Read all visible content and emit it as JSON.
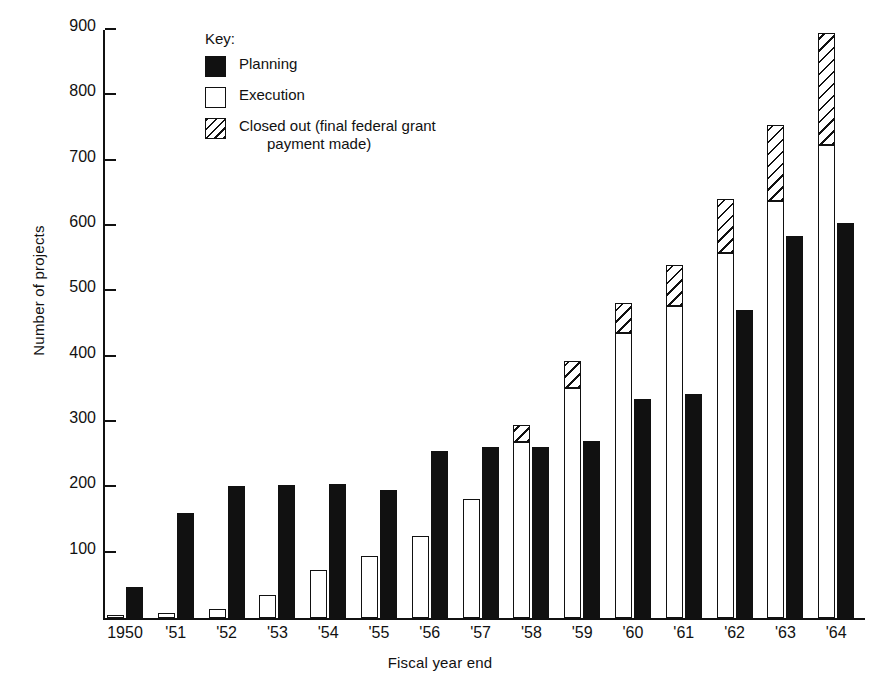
{
  "chart_data": {
    "type": "bar",
    "title": "",
    "xlabel": "Fiscal year end",
    "ylabel": "Number of projects",
    "ylim": [
      0,
      900
    ],
    "yticks": [
      100,
      200,
      300,
      400,
      500,
      600,
      700,
      800,
      900
    ],
    "grid": false,
    "legend_position": "upper-left-inside",
    "legend_title": "Key:",
    "bar_mode": "grouped-with-stacked-execution",
    "categories": [
      "1950",
      "'51",
      "'52",
      "'53",
      "'54",
      "'55",
      "'56",
      "'57",
      "'58",
      "'59",
      "'60",
      "'61",
      "'62",
      "'63",
      "'64"
    ],
    "series": [
      {
        "name": "Planning",
        "fill": "solid-black",
        "values": [
          48,
          160,
          202,
          204,
          205,
          196,
          256,
          261,
          261,
          271,
          335,
          343,
          472,
          584,
          605
        ]
      },
      {
        "name": "Execution",
        "fill": "white",
        "values": [
          5,
          8,
          14,
          35,
          73,
          95,
          125,
          182,
          270,
          352,
          437,
          477,
          558,
          639,
          724
        ]
      },
      {
        "name": "Closed out (final federal grant payment made)",
        "fill": "diagonal-hatch",
        "note": "stacked on top of Execution; cumulative top value",
        "cumulative_top": [
          5,
          8,
          14,
          35,
          73,
          95,
          125,
          182,
          296,
          394,
          482,
          541,
          641,
          755,
          895
        ],
        "values": [
          0,
          0,
          0,
          0,
          0,
          0,
          0,
          0,
          26,
          42,
          45,
          64,
          83,
          116,
          171
        ]
      }
    ]
  },
  "axes": {
    "y_title": "Number of projects",
    "x_title": "Fiscal year end",
    "y_tick_labels": [
      "900",
      "800",
      "700",
      "600",
      "500",
      "400",
      "300",
      "200",
      "100"
    ],
    "x_tick_labels": [
      "1950",
      "'51",
      "'52",
      "'53",
      "'54",
      "'55",
      "'56",
      "'57",
      "'58",
      "'59",
      "'60",
      "'61",
      "'62",
      "'63",
      "'64"
    ]
  },
  "legend": {
    "title": "Key:",
    "items": [
      {
        "label": "Planning",
        "label_cont": ""
      },
      {
        "label": "Execution",
        "label_cont": ""
      },
      {
        "label": "Closed out (final federal grant",
        "label_cont": "payment made)"
      }
    ]
  },
  "colors": {
    "ink": "#111111",
    "paper": "#ffffff"
  }
}
